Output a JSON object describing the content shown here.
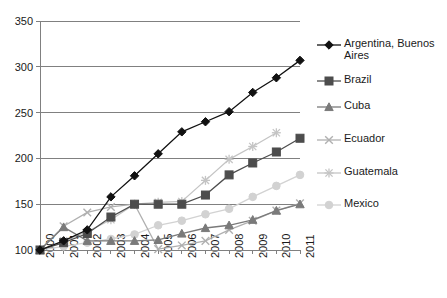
{
  "chart_data": {
    "type": "line",
    "title": "",
    "xlabel": "",
    "ylabel": "",
    "x": [
      "2000",
      "2001",
      "2002",
      "2003",
      "2004",
      "2005",
      "2006",
      "2007",
      "2008",
      "2009",
      "2010",
      "2011"
    ],
    "categories": [
      "2000",
      "2001",
      "2002",
      "2003",
      "2004",
      "2005",
      "2006",
      "2007",
      "2008",
      "2009",
      "2010",
      "2011"
    ],
    "ylim": [
      100,
      350
    ],
    "yticks": [
      100,
      150,
      200,
      250,
      300,
      350
    ],
    "grid": "horizontal",
    "legend_position": "right",
    "series": [
      {
        "name": "Argentina, Buenos Aires",
        "color": "#111111",
        "marker": "diamond",
        "values": [
          100,
          110,
          122,
          158,
          181,
          205,
          229,
          240,
          251,
          272,
          288,
          307
        ]
      },
      {
        "name": "Brazil",
        "color": "#4d4d4d",
        "marker": "square",
        "values": [
          100,
          108,
          118,
          136,
          150,
          150,
          150,
          160,
          182,
          195,
          207,
          222
        ]
      },
      {
        "name": "Cuba",
        "color": "#7a7a7a",
        "marker": "triangle",
        "values": [
          100,
          125,
          110,
          110,
          110,
          111,
          118,
          124,
          127,
          133,
          143,
          150
        ]
      },
      {
        "name": "Ecuador",
        "color": "#b0b0b0",
        "marker": "x",
        "values": [
          100,
          126,
          141,
          147,
          150,
          101,
          105,
          110,
          122,
          132,
          143,
          151
        ]
      },
      {
        "name": "Guatemala",
        "color": "#c4c4c4",
        "marker": "asterisk",
        "values": [
          100,
          110,
          120,
          133,
          150,
          152,
          153,
          176,
          199,
          213,
          228,
          null
        ]
      },
      {
        "name": "Mexico",
        "color": "#d2d2d2",
        "marker": "circle",
        "values": [
          100,
          104,
          108,
          112,
          117,
          127,
          132,
          139,
          145,
          158,
          170,
          182
        ]
      }
    ]
  },
  "axis": {
    "y_tick_labels": [
      "350",
      "300",
      "250",
      "200",
      "150",
      "100"
    ],
    "x_tick_labels": [
      "2000",
      "2001",
      "2002",
      "2003",
      "2004",
      "2005",
      "2006",
      "2007",
      "2008",
      "2009",
      "2010",
      "2011"
    ]
  },
  "legend": {
    "items": [
      {
        "label": "Argentina, Buenos Aires",
        "marker": "diamond",
        "color": "#111111"
      },
      {
        "label": "Brazil",
        "marker": "square",
        "color": "#4d4d4d"
      },
      {
        "label": "Cuba",
        "marker": "triangle",
        "color": "#7a7a7a"
      },
      {
        "label": "Ecuador",
        "marker": "x",
        "color": "#b0b0b0"
      },
      {
        "label": "Guatemala",
        "marker": "asterisk",
        "color": "#c4c4c4"
      },
      {
        "label": "Mexico",
        "marker": "circle",
        "color": "#d2d2d2"
      }
    ]
  }
}
